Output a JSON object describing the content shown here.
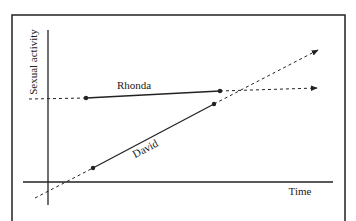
{
  "diagram": {
    "y_axis_label": "Sexual activity",
    "x_axis_label": "Time",
    "series": [
      {
        "name": "Rhonda",
        "label": "Rhonda",
        "trend": "slight increase over time"
      },
      {
        "name": "David",
        "label": "David",
        "trend": "steep increase over time, crossing Rhonda"
      }
    ],
    "colors": {
      "line": "#222222",
      "background": "#ffffff"
    }
  }
}
